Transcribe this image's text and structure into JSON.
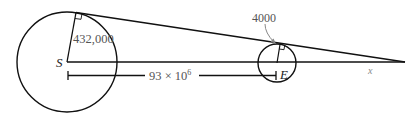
{
  "diagram": {
    "type": "geometry",
    "sun": {
      "label": "S",
      "radius_label": "432,000"
    },
    "earth": {
      "label": "E",
      "radius_label": "4000"
    },
    "distance_label": "93 × 10",
    "distance_exponent": "6",
    "apex_distance_label": "x",
    "colors": {
      "stroke": "#111111",
      "label": "#555555",
      "background": "#ffffff"
    }
  }
}
